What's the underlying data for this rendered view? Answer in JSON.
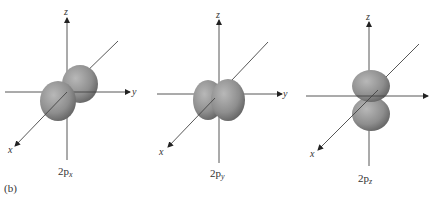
{
  "figure_label": "(b)",
  "panels": [
    {
      "id": "2px",
      "caption_main": "2p",
      "caption_sub": "x",
      "axes": {
        "z": "z",
        "y": "y",
        "x": "x"
      },
      "orientation": "lobes along x-axis"
    },
    {
      "id": "2py",
      "caption_main": "2p",
      "caption_sub": "y",
      "axes": {
        "z": "z",
        "y": "y",
        "x": "x"
      },
      "orientation": "lobes along y-axis"
    },
    {
      "id": "2pz",
      "caption_main": "2p",
      "caption_sub": "z",
      "axes": {
        "z": "z",
        "y": "y",
        "x": "x"
      },
      "orientation": "lobes along z-axis"
    }
  ],
  "colors": {
    "lobe_light": "#b4b4b4",
    "lobe_dark": "#5e5e5e",
    "axis": "#444444"
  }
}
